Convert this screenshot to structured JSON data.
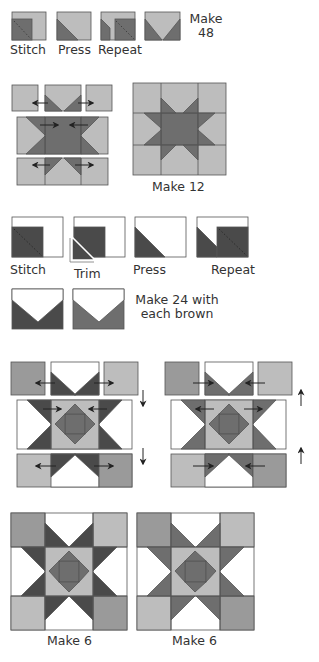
{
  "colors": {
    "light_gray": "#bdbdbd",
    "medium_gray": "#9a9a9a",
    "dark_brown": "#4a4a4a",
    "mid_brown": "#6e6e6e",
    "white": "#ffffff",
    "outline": "#555555"
  },
  "step1": {
    "labels": [
      "Stitch",
      "Press",
      "Repeat"
    ],
    "result_line1": "Make",
    "result_line2": "48"
  },
  "step2": {
    "result": "Make 12"
  },
  "step3": {
    "labels": [
      "Stitch",
      "Trim",
      "Press",
      "Repeat"
    ]
  },
  "step4": {
    "result_line1": "Make 24 with",
    "result_line2": "each brown"
  },
  "step6": {
    "results": [
      "Make 6",
      "Make 6"
    ]
  }
}
